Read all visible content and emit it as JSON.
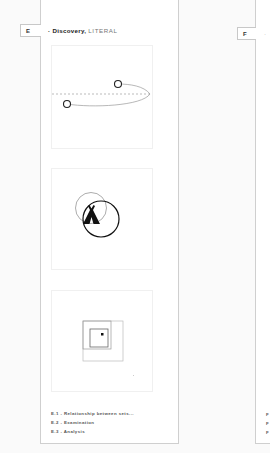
{
  "panels": [
    {
      "id": "E",
      "tab_label": "E",
      "title_bold": "· Discovery,",
      "title_light": "LITERAL",
      "frames": [
        {
          "name": "relationship-between-sets-diagram",
          "icon": "orbit-path-icon"
        },
        {
          "name": "examination-diagram",
          "icon": "tent-icon"
        },
        {
          "name": "analysis-diagram",
          "icon": "nested-squares-icon"
        }
      ],
      "captions": [
        {
          "num": "E.1",
          "sep": " - ",
          "text": "Relationship between sets..."
        },
        {
          "num": "E.2",
          "sep": " - ",
          "text": "Examination"
        },
        {
          "num": "E.3",
          "sep": " - ",
          "text": "Analysis"
        }
      ]
    },
    {
      "id": "F",
      "tab_label": "F",
      "title_bold": "·",
      "captions": [
        {
          "num": "F"
        },
        {
          "num": "F"
        },
        {
          "num": "F"
        }
      ]
    }
  ],
  "colors": {
    "border": "#cfcfcf",
    "ink": "#222222",
    "dashed": "#aaaaaa"
  }
}
